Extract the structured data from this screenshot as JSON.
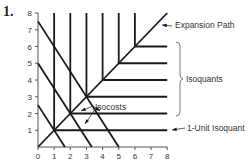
{
  "problem_number": "1.",
  "chart_data": {
    "type": "diagram",
    "title": "",
    "xlabel": "",
    "ylabel": "",
    "xlim": [
      0,
      8
    ],
    "ylim": [
      0,
      8
    ],
    "x_ticks": [
      "0",
      "1",
      "2",
      "3",
      "4",
      "5",
      "6",
      "7",
      "8"
    ],
    "y_ticks": [
      "1",
      "2",
      "3",
      "4",
      "5",
      "6",
      "7",
      "8"
    ],
    "expansion_path": {
      "from": [
        0,
        0
      ],
      "to": [
        8,
        8
      ],
      "label": "Expansion Path"
    },
    "isoquants": [
      {
        "corner": [
          1,
          1
        ],
        "label": "1-Unit Isoquant"
      },
      {
        "corner": [
          2,
          2
        ]
      },
      {
        "corner": [
          3,
          3
        ]
      },
      {
        "corner": [
          4,
          4
        ]
      },
      {
        "corner": [
          5,
          5
        ]
      },
      {
        "corner": [
          6,
          6
        ]
      }
    ],
    "isoquants_label": "Isoquants",
    "isocosts": [
      {
        "x_intercept": 1.667,
        "y_intercept": 2.5
      },
      {
        "x_intercept": 3.333,
        "y_intercept": 5
      },
      {
        "x_intercept": 5,
        "y_intercept": 7.5
      }
    ],
    "isocosts_label": "Isocosts",
    "grid": false
  }
}
